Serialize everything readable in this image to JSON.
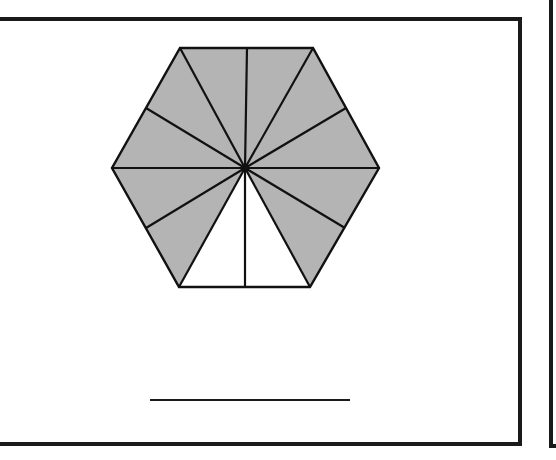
{
  "worksheet": {
    "frame": {
      "stroke": "#1a1a1a",
      "stroke_width": 4,
      "top_y": 19,
      "bottom_y": 444,
      "right_x": 520,
      "next_frame_x": 551
    },
    "hexagon": {
      "center": [
        245,
        168
      ],
      "vertices": [
        [
          180,
          48
        ],
        [
          313,
          48
        ],
        [
          379,
          168
        ],
        [
          310,
          287
        ],
        [
          179,
          287
        ],
        [
          112,
          168
        ]
      ],
      "divisions": 12,
      "shaded_count": 10,
      "unshaded_count": 2,
      "shaded_fraction_label": "10/12",
      "shade_color": "#b4b4b4",
      "line_color": "#111111",
      "spoke_points": [
        [
          180,
          48
        ],
        [
          247,
          48
        ],
        [
          313,
          48
        ],
        [
          346,
          108
        ],
        [
          379,
          168
        ],
        [
          345,
          228
        ],
        [
          310,
          287
        ],
        [
          245,
          287
        ],
        [
          179,
          287
        ],
        [
          146,
          228
        ],
        [
          112,
          168
        ],
        [
          146,
          108
        ]
      ],
      "shaded": [
        true,
        true,
        true,
        true,
        true,
        true,
        false,
        false,
        true,
        true,
        true,
        true
      ]
    },
    "answer_line": {
      "x1": 150,
      "x2": 350,
      "y": 400,
      "value": ""
    }
  }
}
